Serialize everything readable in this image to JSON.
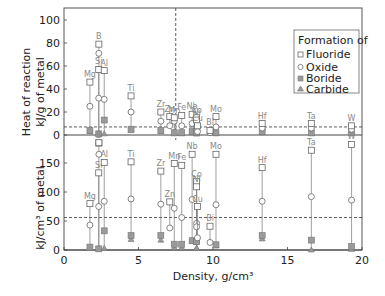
{
  "chart_data": {
    "type": "scatter",
    "xlabel": "Density, g/cm³",
    "xlim": [
      0,
      20
    ],
    "xticks": [
      0,
      5,
      10,
      15,
      20
    ],
    "legend": {
      "title": "Formation of",
      "entries": [
        "Fluoride",
        "Oxide",
        "Boride",
        "Carbide"
      ],
      "position": "upper right"
    },
    "panels": [
      {
        "name": "top",
        "ylabel": "Heat of reaction\nkJ/g of metal",
        "ylim": [
          -10,
          100
        ],
        "yticks": [
          0,
          20,
          40,
          60,
          80,
          100
        ],
        "reference_line": 7,
        "elements": [
          {
            "el": "Mg",
            "x": 1.74,
            "fluoride": 46,
            "oxide": 25,
            "boride": 4,
            "carbide": 3
          },
          {
            "el": "B",
            "x": 2.34,
            "fluoride": 79,
            "oxide": 71,
            "boride": null,
            "carbide": 1,
            "fluoride_neg": -7
          },
          {
            "el": "Si",
            "x": 2.33,
            "fluoride": 57,
            "oxide": 32,
            "boride": 1,
            "carbide": 1
          },
          {
            "el": "Al",
            "x": 2.7,
            "fluoride": 56,
            "oxide": 31,
            "boride": 13,
            "carbide": 1
          },
          {
            "el": "Ti",
            "x": 4.5,
            "fluoride": 34,
            "oxide": 20,
            "boride": 5,
            "carbide": 4
          },
          {
            "el": "Zr",
            "x": 6.5,
            "fluoride": 20,
            "oxide": 12,
            "boride": 4,
            "carbide": 3
          },
          {
            "el": "Zn",
            "x": 7.1,
            "fluoride": 16,
            "oxide": 8,
            "boride": null,
            "carbide": null
          },
          {
            "el": "Mn",
            "x": 7.4,
            "fluoride": 15,
            "oxide": 12,
            "boride": 2,
            "carbide": 1
          },
          {
            "el": "Fe",
            "x": 7.9,
            "fluoride": 17,
            "oxide": 8,
            "boride": 2,
            "carbide": 1
          },
          {
            "el": "Nb",
            "x": 8.6,
            "fluoride": 18,
            "oxide": 10,
            "boride": 3,
            "carbide": 2
          },
          {
            "el": "Co",
            "x": 8.9,
            "fluoride": 15,
            "oxide": 7,
            "boride": 2,
            "carbide": 1
          },
          {
            "el": "Ni",
            "x": 8.9,
            "fluoride": 13,
            "oxide": 6,
            "boride": 2,
            "carbide": 1
          },
          {
            "el": "Cu",
            "x": 8.96,
            "fluoride": 8,
            "oxide": 3,
            "boride": null,
            "carbide": null
          },
          {
            "el": "Mo",
            "x": 10.2,
            "fluoride": 16,
            "oxide": 7,
            "boride": 2,
            "carbide": 1
          },
          {
            "el": "Bi",
            "x": 9.8,
            "fluoride": 4,
            "oxide": 2,
            "boride": null,
            "carbide": null
          },
          {
            "el": "Hf",
            "x": 13.3,
            "fluoride": 10,
            "oxide": 6,
            "boride": 3,
            "carbide": 2
          },
          {
            "el": "Ta",
            "x": 16.6,
            "fluoride": 10,
            "oxide": 6,
            "boride": 2,
            "carbide": 1
          },
          {
            "el": "W",
            "x": 19.3,
            "fluoride": 8,
            "oxide": 5,
            "boride": 2,
            "carbide": 1
          }
        ]
      },
      {
        "name": "bottom",
        "ylabel": "kJ/cm³ of metal",
        "ylim": [
          0,
          200
        ],
        "yticks": [
          0,
          50,
          100,
          150
        ],
        "reference_line": 56,
        "elements": [
          {
            "el": "Mg",
            "x": 1.74,
            "fluoride": 80,
            "oxide": 43,
            "boride": 5,
            "carbide": 3
          },
          {
            "el": "B",
            "x": 2.34,
            "fluoride": 185,
            "oxide": 165,
            "boride": null,
            "carbide": 2
          },
          {
            "el": "Si",
            "x": 2.33,
            "fluoride": 133,
            "oxide": 75,
            "boride": 2,
            "carbide": 2
          },
          {
            "el": "Al",
            "x": 2.7,
            "fluoride": 151,
            "oxide": 84,
            "boride": 33,
            "carbide": 3
          },
          {
            "el": "Ti",
            "x": 4.5,
            "fluoride": 152,
            "oxide": 88,
            "boride": 25,
            "carbide": 18
          },
          {
            "el": "Zr",
            "x": 6.5,
            "fluoride": 136,
            "oxide": 79,
            "boride": 25,
            "carbide": 17
          },
          {
            "el": "Zn",
            "x": 7.1,
            "fluoride": 83,
            "oxide": 38,
            "boride": null,
            "carbide": null
          },
          {
            "el": "Mn",
            "x": 7.4,
            "fluoride": 149,
            "oxide": 72,
            "boride": 10,
            "carbide": 4
          },
          {
            "el": "Fe",
            "x": 7.9,
            "fluoride": 146,
            "oxide": 56,
            "boride": 10,
            "carbide": 4
          },
          {
            "el": "Nb",
            "x": 8.6,
            "fluoride": 165,
            "oxide": 87,
            "boride": 16,
            "carbide": 15
          },
          {
            "el": "Co",
            "x": 8.9,
            "fluoride": 118,
            "oxide": 46,
            "boride": 15,
            "carbide": 3
          },
          {
            "el": "Ni",
            "x": 8.9,
            "fluoride": 109,
            "oxide": 40,
            "boride": 15,
            "carbide": 3
          },
          {
            "el": "Cu",
            "x": 8.96,
            "fluoride": 75,
            "oxide": 21,
            "boride": null,
            "carbide": null
          },
          {
            "el": "Mo",
            "x": 10.2,
            "fluoride": 165,
            "oxide": 78,
            "boride": 9,
            "carbide": 7
          },
          {
            "el": "Bi",
            "x": 9.8,
            "fluoride": 41,
            "oxide": 13,
            "boride": null,
            "carbide": null
          },
          {
            "el": "Hf",
            "x": 13.3,
            "fluoride": 142,
            "oxide": 84,
            "boride": 25,
            "carbide": 19
          },
          {
            "el": "Ta",
            "x": 16.6,
            "fluoride": 172,
            "oxide": 92,
            "boride": 17,
            "carbide": 0
          },
          {
            "el": "W",
            "x": 19.3,
            "fluoride": 182,
            "oxide": 86,
            "boride": 6,
            "carbide": 1
          }
        ]
      }
    ]
  },
  "labels": {
    "ylabel_top_1": "Heat of reaction",
    "ylabel_top_2": "kJ/g of metal",
    "ylabel_bottom": "kJ/cm³ of metal",
    "xlabel": "Density, g/cm³",
    "legend_title": "Formation of",
    "legend_fluoride": "Fluoride",
    "legend_oxide": "Oxide",
    "legend_boride": "Boride",
    "legend_carbide": "Carbide"
  },
  "colors": {
    "marker_stroke": "#666666",
    "marker_fill": "#9a9a9a",
    "axis": "#444444",
    "label": "#888888"
  }
}
